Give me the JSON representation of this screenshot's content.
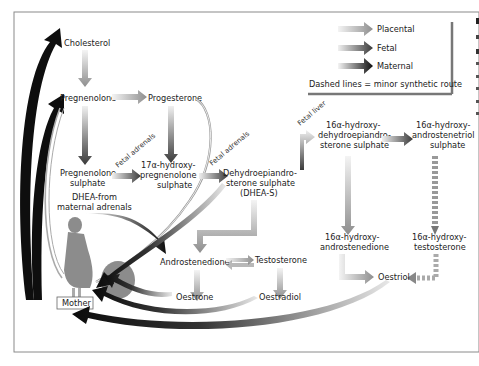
{
  "legend": {
    "items": [
      {
        "label": "Placental",
        "color_from": "#ffffff",
        "color_to": "#9a9a9a"
      },
      {
        "label": "Fetal",
        "color_from": "#ffffff",
        "color_to": "#444444"
      },
      {
        "label": "Maternal",
        "color_from": "#ffffff",
        "color_to": "#111111"
      }
    ],
    "note": "Dashed lines = minor synthetic route"
  },
  "nodes": {
    "cholesterol": "Cholesterol",
    "pregnenolone": "Pregnenolone",
    "progesterone": "Progesterone",
    "pregnenolone_sulphate": [
      "Pregnenolone",
      "sulphate"
    ],
    "hydroxy_pregnenolone_sulphate": [
      "17α-hydroxy-",
      "pregnenolone",
      "sulphate"
    ],
    "dheas": [
      "Dehydroepiandro-",
      "sterone sulphate",
      "(DHEA-S)"
    ],
    "hydroxy_dheas": [
      "16α-hydroxy-",
      "dehydroepiandro-",
      "sterone sulphate"
    ],
    "hydroxy_androstenetriol": [
      "16α-hydroxy-",
      "androstenetriol",
      "sulphate"
    ],
    "hydroxy_androstenedione": [
      "16α-hydroxy-",
      "androstenedione"
    ],
    "hydroxy_testosterone": [
      "16α-hydroxy-",
      "testosterone"
    ],
    "dhea_maternal": [
      "DHEA-from",
      "maternal adrenals"
    ],
    "androstenedione": "Androstenedione",
    "testosterone": "Testosterone",
    "oestrone": "Oestrone",
    "oestradiol": "Oestradiol",
    "oestriol": "Oestriol",
    "mother": "Mother"
  },
  "route_labels": {
    "fetal_adrenals_1": "Fetal adrenals",
    "fetal_adrenals_2": "Fetal adrenals",
    "fetal_liver": "Fetal liver"
  },
  "colors": {
    "frame": "#8a8a8a",
    "placental": "#9a9a9a",
    "fetal": "#444444",
    "maternal": "#111111",
    "mother_figure": "#8c8c8c"
  }
}
